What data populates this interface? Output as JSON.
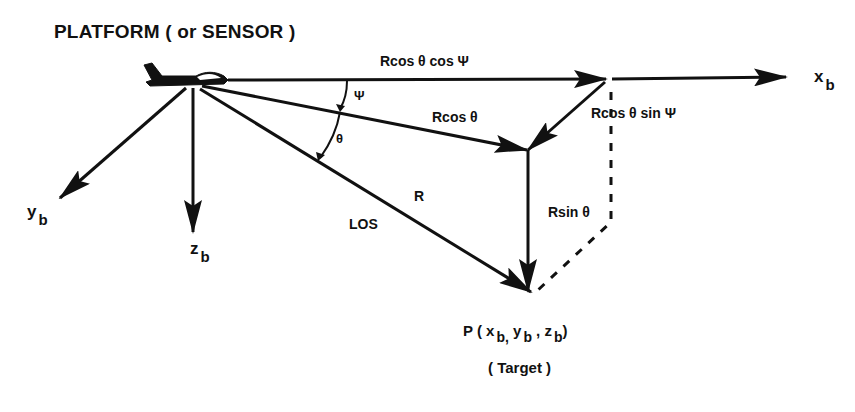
{
  "diagram": {
    "title": "PLATFORM ( or SENSOR )",
    "labels": {
      "x_component": "Rcos θ cos Ψ",
      "horizontal_projection": "Rcos θ",
      "y_component": "Rcos θ sin Ψ",
      "z_component": "Rsin θ",
      "range": "R",
      "los": "LOS",
      "psi": "Ψ",
      "theta": "θ"
    },
    "axes": {
      "x": {
        "base": "x",
        "sub": "b"
      },
      "y": {
        "base": "y",
        "sub": "b"
      },
      "z": {
        "base": "z",
        "sub": "b"
      }
    },
    "target": {
      "point_label": "P ( x",
      "coords": "P ( x b, y b , z b )",
      "x_sub": "b,",
      "y": "y",
      "y_sub": "b",
      "z": "z",
      "z_sub": "b",
      "sep": ",",
      "close": ")",
      "caption": "( Target )"
    },
    "colors": {
      "ink": "#111111",
      "background": "#ffffff"
    }
  }
}
